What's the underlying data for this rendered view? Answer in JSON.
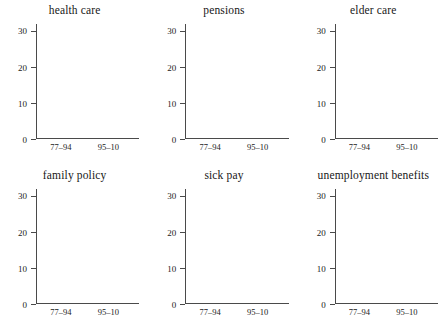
{
  "chart_data": {
    "type": "bar",
    "title": "",
    "subtitle": "",
    "xlabel": "",
    "ylabel": "",
    "ylim": [
      0,
      32
    ],
    "yticks": [
      0,
      10,
      20,
      30
    ],
    "ytick_labels": [
      "0",
      "10",
      "20",
      "30"
    ],
    "categories": [
      "77–94",
      "95–10"
    ],
    "grid": false,
    "legend_position": "none",
    "stacked": true,
    "series": [
      {
        "name": "lower-segment",
        "color": "#5d5d5d"
      },
      {
        "name": "upper-segment",
        "color": "#a9a9a9"
      }
    ],
    "panels": [
      {
        "title": "health care",
        "bars": [
          {
            "category": "77–94",
            "lower": 5.2,
            "upper": 3.6,
            "total": 8.8
          },
          {
            "category": "95–10",
            "lower": 16.8,
            "upper": 8.4,
            "total": 25.2
          }
        ]
      },
      {
        "title": "pensions",
        "bars": [
          {
            "category": "77–94",
            "lower": 4.2,
            "upper": 4.6,
            "total": 8.8
          },
          {
            "category": "95–10",
            "lower": 8.2,
            "upper": 6.0,
            "total": 14.2
          }
        ]
      },
      {
        "title": "elder care",
        "bars": [
          {
            "category": "77–94",
            "lower": 0.0,
            "upper": 1.0,
            "total": 1.0
          },
          {
            "category": "95–10",
            "lower": 6.9,
            "upper": 4.4,
            "total": 11.3
          }
        ]
      },
      {
        "title": "family policy",
        "bars": [
          {
            "category": "77–94",
            "lower": 2.0,
            "upper": 5.5,
            "total": 7.5
          },
          {
            "category": "95–10",
            "lower": 4.0,
            "upper": 4.2,
            "total": 8.2
          }
        ]
      },
      {
        "title": "sick pay",
        "bars": [
          {
            "category": "77–94",
            "lower": 1.0,
            "upper": 4.1,
            "total": 5.1
          },
          {
            "category": "95–10",
            "lower": 0.9,
            "upper": 3.1,
            "total": 4.0
          }
        ]
      },
      {
        "title": "unemployment benefits",
        "bars": [
          {
            "category": "77–94",
            "lower": 2.0,
            "upper": 0.2,
            "total": 2.2
          },
          {
            "category": "95–10",
            "lower": 0.3,
            "upper": 2.3,
            "total": 2.6
          }
        ]
      }
    ]
  },
  "caption": ""
}
